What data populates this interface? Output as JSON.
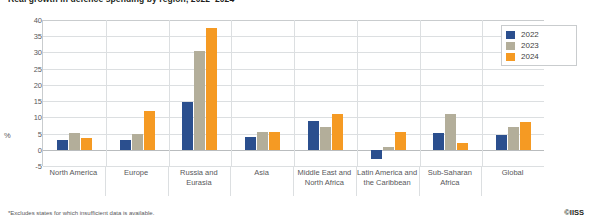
{
  "chart_data": {
    "type": "bar",
    "title": "Real growth in defence spending by region, 2022–2024*",
    "xlabel": "",
    "ylabel": "%",
    "ylim": [
      -5,
      40
    ],
    "yticks": [
      40,
      35,
      30,
      25,
      20,
      15,
      10,
      5,
      0,
      -5
    ],
    "grid": true,
    "legend_position": "top-right",
    "categories": [
      "North America",
      "Europe",
      "Russia and Eurasia",
      "Asia",
      "Middle East and North Africa",
      "Latin America and the Caribbean",
      "Sub-Saharan Africa",
      "Global"
    ],
    "series": [
      {
        "name": "2022",
        "color": "#2b4f8e",
        "values": [
          3.0,
          3.0,
          14.7,
          4.0,
          9.0,
          -3.0,
          5.2,
          4.5
        ]
      },
      {
        "name": "2023",
        "color": "#b3ae9a",
        "values": [
          5.2,
          5.0,
          30.5,
          5.5,
          7.0,
          1.0,
          11.0,
          7.0
        ]
      },
      {
        "name": "2024",
        "color": "#f59a23",
        "values": [
          3.5,
          12.0,
          37.5,
          5.5,
          11.0,
          5.5,
          2.0,
          8.5
        ]
      }
    ]
  },
  "legend": {
    "items": [
      {
        "label": "2022",
        "color": "#2b4f8e"
      },
      {
        "label": "2023",
        "color": "#b3ae9a"
      },
      {
        "label": "2024",
        "color": "#f59a23"
      }
    ]
  },
  "footnote": "*Excludes states for which insufficient data is available.",
  "credit": "©IISS"
}
